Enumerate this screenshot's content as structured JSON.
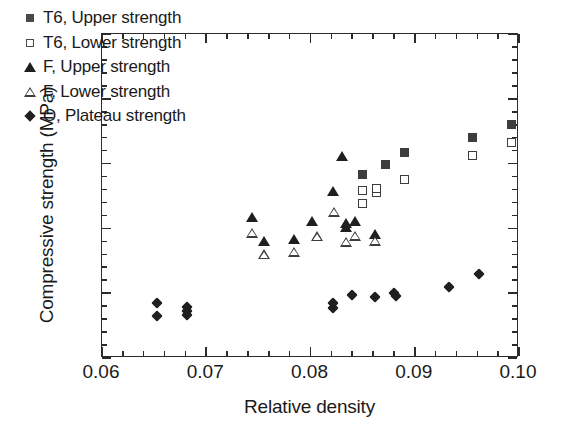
{
  "chart_data": {
    "type": "scatter",
    "title": "",
    "xlabel": "Relative density",
    "ylabel": "Compressive strength (MPa)",
    "xlim": [
      0.06,
      0.1
    ],
    "ylim": [
      0.0,
      5.0
    ],
    "xticks": [
      0.06,
      0.07,
      0.08,
      0.09,
      0.1
    ],
    "xticklabels": [
      "0.06",
      "0.07",
      "0.08",
      "0.09",
      "0.10"
    ],
    "yticks": [
      0.0,
      1.0,
      2.0,
      3.0,
      4.0,
      5.0
    ],
    "yticklabels": [
      "0.0",
      "1.0",
      "2.0",
      "3.0",
      "4.0",
      "5.0"
    ],
    "x_minor_tick_step": 0.002,
    "y_minor_tick_step": 0.2,
    "grid": false,
    "legend_position": "upper left",
    "series": [
      {
        "name": "T6, Upper strength",
        "marker": "filled-square",
        "color": "#3d3d3d",
        "points": [
          [
            0.085,
            2.83
          ],
          [
            0.0872,
            2.99
          ],
          [
            0.089,
            3.17
          ],
          [
            0.0955,
            3.4
          ],
          [
            0.0993,
            3.61
          ]
        ]
      },
      {
        "name": "T6, Lower strength",
        "marker": "open-square",
        "color": "#3d3d3d",
        "points": [
          [
            0.085,
            2.38
          ],
          [
            0.085,
            2.58
          ],
          [
            0.0863,
            2.55
          ],
          [
            0.0863,
            2.61
          ],
          [
            0.089,
            2.75
          ],
          [
            0.0955,
            3.12
          ],
          [
            0.0993,
            3.32
          ]
        ]
      },
      {
        "name": "F, Upper strength",
        "marker": "filled-triangle",
        "color": "#1f1f1f",
        "points": [
          [
            0.0744,
            2.17
          ],
          [
            0.0755,
            1.8
          ],
          [
            0.0784,
            1.84
          ],
          [
            0.0801,
            2.11
          ],
          [
            0.0822,
            2.57
          ],
          [
            0.083,
            3.12
          ],
          [
            0.0834,
            2.02
          ],
          [
            0.0834,
            2.09
          ],
          [
            0.0843,
            2.11
          ],
          [
            0.0862,
            1.91
          ]
        ]
      },
      {
        "name": "F, Lower strength",
        "marker": "open-triangle",
        "color": "#3d3d3d",
        "points": [
          [
            0.0744,
            1.93
          ],
          [
            0.0755,
            1.6
          ],
          [
            0.0784,
            1.64
          ],
          [
            0.0806,
            1.88
          ],
          [
            0.0823,
            2.26
          ],
          [
            0.0834,
            1.79
          ],
          [
            0.0843,
            1.89
          ],
          [
            0.0862,
            1.81
          ]
        ]
      },
      {
        "name": "O, Plateau strength",
        "marker": "filled-diamond",
        "color": "#1f1f1f",
        "points": [
          [
            0.0653,
            0.85
          ],
          [
            0.0653,
            0.65
          ],
          [
            0.0682,
            0.79
          ],
          [
            0.0682,
            0.73
          ],
          [
            0.0682,
            0.66
          ],
          [
            0.0822,
            0.85
          ],
          [
            0.0822,
            0.77
          ],
          [
            0.084,
            0.97
          ],
          [
            0.0862,
            0.94
          ],
          [
            0.088,
            1.0
          ],
          [
            0.0882,
            0.95
          ],
          [
            0.0933,
            1.1
          ],
          [
            0.0962,
            1.29
          ]
        ]
      }
    ]
  },
  "legend": {
    "items": [
      {
        "label": "T6, Upper strength",
        "marker": "filled-square"
      },
      {
        "label": "T6, Lower strength",
        "marker": "open-square"
      },
      {
        "label": "F, Upper strength",
        "marker": "filled-triangle"
      },
      {
        "label": "F, Lower strength",
        "marker": "open-triangle"
      },
      {
        "label": "O, Plateau strength",
        "marker": "filled-diamond"
      }
    ]
  }
}
